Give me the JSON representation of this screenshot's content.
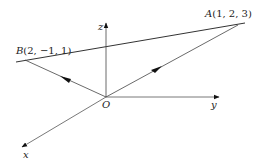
{
  "diagram": {
    "axes": {
      "x": {
        "label": "x"
      },
      "y": {
        "label": "y"
      },
      "z": {
        "label": "z"
      }
    },
    "origin": {
      "label": "O"
    },
    "points": {
      "A": {
        "name": "A",
        "coords": "(1, 2, 3)"
      },
      "B": {
        "name": "B",
        "coords": "(2, −1, 1)"
      }
    },
    "vectors": [
      {
        "from": "O",
        "to": "A"
      },
      {
        "from": "O",
        "to": "B"
      }
    ],
    "line": {
      "through": [
        "B",
        "A"
      ]
    },
    "colors": {
      "stroke": "#333333",
      "text": "#222222"
    }
  }
}
